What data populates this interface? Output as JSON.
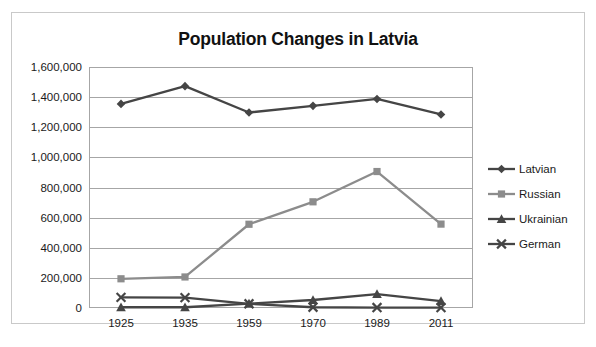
{
  "chart_data": {
    "type": "line",
    "title": "Population Changes in Latvia",
    "xlabel": "",
    "ylabel": "",
    "categories": [
      "1925",
      "1935",
      "1959",
      "1970",
      "1989",
      "2011"
    ],
    "ylim": [
      0,
      1600000
    ],
    "ytick_values": [
      0,
      200000,
      400000,
      600000,
      800000,
      1000000,
      1200000,
      1400000,
      1600000
    ],
    "ytick_labels": [
      "0",
      "200,000",
      "400,000",
      "600,000",
      "800,000",
      "1,000,000",
      "1,200,000",
      "1,400,000",
      "1,600,000"
    ],
    "grid": true,
    "legend_position": "right",
    "series": [
      {
        "name": "Latvian",
        "marker": "diamond",
        "color": "#454545",
        "values": [
          1355000,
          1473000,
          1298000,
          1342000,
          1388000,
          1285000
        ]
      },
      {
        "name": "Russian",
        "marker": "square",
        "color": "#8c8c8c",
        "values": [
          194000,
          206000,
          556000,
          705000,
          906000,
          557000
        ]
      },
      {
        "name": "Ukrainian",
        "marker": "triangle",
        "color": "#454545",
        "values": [
          5000,
          5000,
          29000,
          53000,
          92000,
          46000
        ]
      },
      {
        "name": "German",
        "marker": "x",
        "color": "#454545",
        "values": [
          71000,
          69000,
          28000,
          5000,
          3000,
          3000
        ]
      }
    ]
  },
  "legend": {
    "items": [
      {
        "label": "Latvian"
      },
      {
        "label": "Russian"
      },
      {
        "label": "Ukrainian"
      },
      {
        "label": "German"
      }
    ]
  }
}
